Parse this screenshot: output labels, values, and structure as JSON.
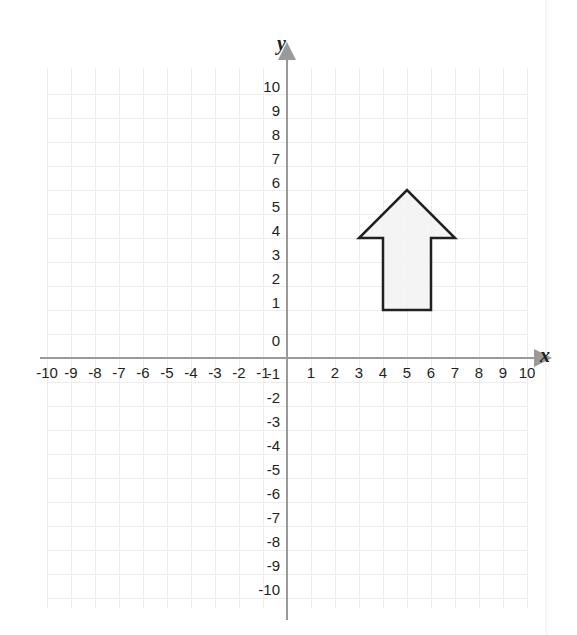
{
  "figure": {
    "kind": "coordinate-plane",
    "background_color": "#ffffff"
  },
  "chart_data": {
    "type": "scatter",
    "title": "",
    "xlabel": "x",
    "ylabel": "y",
    "xlim": [
      -10,
      10
    ],
    "ylim": [
      -10,
      10
    ],
    "grid": true,
    "grid_step": 1,
    "legend": "none",
    "x_tick_labels": [
      "-10",
      "-9",
      "-8",
      "-7",
      "-6",
      "-5",
      "-4",
      "-3",
      "-2",
      "-1",
      "1",
      "2",
      "3",
      "4",
      "5",
      "6",
      "7",
      "8",
      "9",
      "10"
    ],
    "x_tick_values": [
      -10,
      -9,
      -8,
      -7,
      -6,
      -5,
      -4,
      -3,
      -2,
      -1,
      1,
      2,
      3,
      4,
      5,
      6,
      7,
      8,
      9,
      10
    ],
    "y_tick_labels": [
      "10",
      "9",
      "8",
      "7",
      "6",
      "5",
      "4",
      "3",
      "2",
      "1",
      "0",
      "-1",
      "-2",
      "-3",
      "-4",
      "-5",
      "-6",
      "-7",
      "-8",
      "-9",
      "-10"
    ],
    "y_tick_values": [
      10,
      9,
      8,
      7,
      6,
      5,
      4,
      3,
      2,
      1,
      0,
      -1,
      -2,
      -3,
      -4,
      -5,
      -6,
      -7,
      -8,
      -9,
      -10
    ],
    "origin_label": "0",
    "shapes": [
      {
        "name": "arrow-polygon",
        "type": "polygon",
        "fill": "#f2f2f2",
        "stroke": "#231f20",
        "stroke_width": 2.5,
        "vertices": [
          [
            4,
            2
          ],
          [
            4,
            5
          ],
          [
            3,
            5
          ],
          [
            5,
            7
          ],
          [
            7,
            5
          ],
          [
            6,
            5
          ],
          [
            6,
            2
          ]
        ]
      }
    ]
  },
  "axes": {
    "x_axis_label": "x",
    "y_axis_label": "y",
    "axis_color": "#8c8c8c",
    "grid_color": "#ededed",
    "tick_text_color": "#231f20"
  }
}
